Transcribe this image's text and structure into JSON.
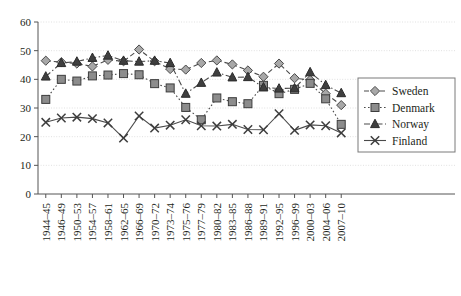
{
  "chart_data": {
    "type": "line",
    "title": "",
    "subtitle": "",
    "xlabel": "",
    "ylabel": "",
    "ylim": [
      0,
      60
    ],
    "yticks": [
      0,
      10,
      20,
      30,
      40,
      50,
      60
    ],
    "ytick_labels": [
      "0",
      "10",
      "20",
      "30",
      "40",
      "50",
      "60"
    ],
    "grid": true,
    "grid_axis": "y",
    "legend_position": "right",
    "categories": [
      "1944–45",
      "1946–49",
      "1950–53",
      "1954–57",
      "1958–61",
      "1962–65",
      "1966–69",
      "1970–72",
      "1973–74",
      "1975–76",
      "1977–79",
      "1980–82",
      "1983–85",
      "1986–88",
      "1989–91",
      "1992–95",
      "1996–99",
      "2000–03",
      "2004–06",
      "2007–10"
    ],
    "series": [
      {
        "name": "Sweden",
        "marker": "diamond",
        "line_style": "dashed",
        "color": "#808080",
        "values": [
          46.5,
          46.0,
          45.5,
          44.5,
          46.8,
          46.3,
          50.4,
          46.3,
          43.6,
          43.4,
          45.7,
          46.6,
          45.2,
          43.1,
          40.9,
          45.5,
          40.4,
          39.8,
          35.0,
          31.0
        ]
      },
      {
        "name": "Denmark",
        "marker": "square",
        "line_style": "dotted",
        "color": "#6e6e6e",
        "values": [
          33.0,
          40.0,
          39.4,
          41.2,
          41.5,
          42.0,
          41.6,
          38.5,
          37.0,
          30.2,
          25.9,
          33.5,
          32.2,
          31.5,
          37.9,
          35.0,
          36.5,
          38.6,
          33.2,
          24.3
        ]
      },
      {
        "name": "Norway",
        "marker": "triangle",
        "line_style": "dashdot",
        "color": "#4d4d4d",
        "values": [
          41.0,
          45.7,
          46.2,
          47.5,
          48.3,
          46.5,
          46.2,
          46.5,
          45.7,
          35.0,
          38.8,
          42.4,
          40.7,
          40.8,
          37.2,
          36.8,
          36.9,
          42.5,
          38.0,
          35.2
        ]
      },
      {
        "name": "Finland",
        "marker": "cross",
        "line_style": "solid",
        "color": "#555555",
        "values": [
          25.0,
          26.5,
          26.8,
          26.3,
          24.8,
          19.5,
          27.2,
          23.0,
          24.0,
          25.9,
          23.8,
          23.7,
          24.3,
          22.5,
          22.4,
          28.0,
          22.2,
          24.1,
          23.8,
          21.3
        ]
      }
    ]
  },
  "legend": {
    "entries": [
      {
        "label": "Sweden"
      },
      {
        "label": "Denmark"
      },
      {
        "label": "Norway"
      },
      {
        "label": "Finland"
      }
    ]
  }
}
